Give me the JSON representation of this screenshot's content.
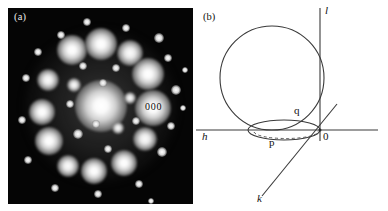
{
  "figure": {
    "panels": [
      {
        "id": "a",
        "label": "(a)",
        "type": "electron-diffraction-pattern",
        "annotations": [
          {
            "text": "000",
            "meaning": "transmitted-beam-spot"
          }
        ]
      },
      {
        "id": "b",
        "label": "(b)",
        "type": "ewald-sphere-diagram",
        "axes": [
          {
            "name": "h",
            "label": "h",
            "orientation": "horizontal"
          },
          {
            "name": "k",
            "label": "k",
            "orientation": "diagonal"
          },
          {
            "name": "l",
            "label": "l",
            "orientation": "vertical"
          }
        ],
        "points": [
          {
            "name": "origin",
            "label": "0"
          },
          {
            "name": "p",
            "label": "p"
          },
          {
            "name": "q",
            "label": "q"
          }
        ]
      }
    ]
  },
  "panel_a": {
    "label": "(a)",
    "center_label": "000",
    "background_color": "#050505",
    "spot_color": "#ffffff",
    "spots": [
      {
        "x": 93,
        "y": 98,
        "r": 26,
        "class": "big"
      },
      {
        "x": 64,
        "y": 42,
        "r": 15,
        "class": "big"
      },
      {
        "x": 93,
        "y": 36,
        "r": 16,
        "class": "big"
      },
      {
        "x": 122,
        "y": 45,
        "r": 13,
        "class": "mid"
      },
      {
        "x": 140,
        "y": 66,
        "r": 16,
        "class": "big"
      },
      {
        "x": 145,
        "y": 100,
        "r": 18,
        "class": "big"
      },
      {
        "x": 137,
        "y": 131,
        "r": 12,
        "class": "mid"
      },
      {
        "x": 116,
        "y": 155,
        "r": 13,
        "class": "big"
      },
      {
        "x": 86,
        "y": 163,
        "r": 13,
        "class": "big"
      },
      {
        "x": 60,
        "y": 158,
        "r": 11,
        "class": "mid"
      },
      {
        "x": 41,
        "y": 133,
        "r": 14,
        "class": "big"
      },
      {
        "x": 34,
        "y": 104,
        "r": 13,
        "class": "big"
      },
      {
        "x": 40,
        "y": 72,
        "r": 11,
        "class": "mid"
      },
      {
        "x": 66,
        "y": 77,
        "r": 7,
        "class": "mid"
      },
      {
        "x": 122,
        "y": 90,
        "r": 6,
        "class": "mid"
      },
      {
        "x": 110,
        "y": 120,
        "r": 6,
        "class": "mid"
      },
      {
        "x": 70,
        "y": 126,
        "r": 5,
        "class": "small"
      },
      {
        "x": 75,
        "y": 58,
        "r": 4,
        "class": "small"
      },
      {
        "x": 108,
        "y": 60,
        "r": 4,
        "class": "small"
      },
      {
        "x": 95,
        "y": 75,
        "r": 4,
        "class": "small"
      },
      {
        "x": 62,
        "y": 96,
        "r": 4,
        "class": "small"
      },
      {
        "x": 88,
        "y": 116,
        "r": 4,
        "class": "small"
      },
      {
        "x": 128,
        "y": 113,
        "r": 4,
        "class": "small"
      },
      {
        "x": 100,
        "y": 141,
        "r": 4,
        "class": "small"
      },
      {
        "x": 53,
        "y": 27,
        "r": 4,
        "class": "small"
      },
      {
        "x": 118,
        "y": 20,
        "r": 4,
        "class": "small"
      },
      {
        "x": 151,
        "y": 30,
        "r": 5,
        "class": "small"
      },
      {
        "x": 160,
        "y": 50,
        "r": 4,
        "class": "small"
      },
      {
        "x": 168,
        "y": 82,
        "r": 5,
        "class": "small"
      },
      {
        "x": 163,
        "y": 118,
        "r": 4,
        "class": "small"
      },
      {
        "x": 154,
        "y": 144,
        "r": 5,
        "class": "small"
      },
      {
        "x": 131,
        "y": 176,
        "r": 4,
        "class": "small"
      },
      {
        "x": 90,
        "y": 186,
        "r": 4,
        "class": "small"
      },
      {
        "x": 47,
        "y": 180,
        "r": 4,
        "class": "small"
      },
      {
        "x": 20,
        "y": 152,
        "r": 4,
        "class": "small"
      },
      {
        "x": 14,
        "y": 112,
        "r": 4,
        "class": "small"
      },
      {
        "x": 18,
        "y": 70,
        "r": 4,
        "class": "small"
      },
      {
        "x": 30,
        "y": 44,
        "r": 4,
        "class": "small"
      },
      {
        "x": 79,
        "y": 14,
        "r": 4,
        "class": "small"
      },
      {
        "x": 177,
        "y": 62,
        "r": 3,
        "class": "small"
      },
      {
        "x": 175,
        "y": 100,
        "r": 3,
        "class": "small"
      },
      {
        "x": 143,
        "y": 193,
        "r": 3,
        "class": "small"
      }
    ]
  },
  "panel_b": {
    "label": "(b)",
    "line_color": "#333333",
    "axis_h": {
      "label": "h"
    },
    "axis_k": {
      "label": "k"
    },
    "axis_l": {
      "label": "l"
    },
    "origin": {
      "label": "0"
    },
    "point_p": {
      "label": "p"
    },
    "point_q": {
      "label": "q"
    }
  }
}
